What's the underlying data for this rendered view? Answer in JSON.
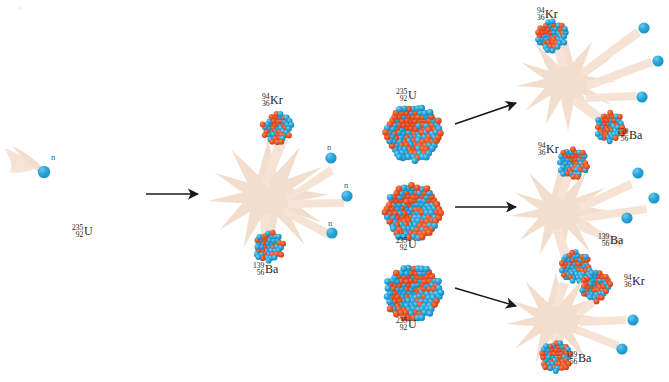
{
  "figure": {
    "background_color": "#ffffff"
  },
  "colors": {
    "proton": "#e8502a",
    "neutron_sphere": "#29a8dc",
    "burst": "#f3ddcd",
    "ray": "#f6e3d6",
    "arrow": "#1a1a1a",
    "label_text": "#231f20",
    "neutron_label_text": "#2b6c88"
  },
  "isotopes": {
    "uranium": {
      "mass": "235",
      "atomic": "92",
      "symbol": "U"
    },
    "krypton": {
      "mass": "94",
      "atomic": "36",
      "symbol": "Kr"
    },
    "barium": {
      "mass": "139",
      "atomic": "56",
      "symbol": "Ba"
    }
  },
  "neutron_label": "n",
  "generations": [
    {
      "name": "generation-0",
      "incoming_neutron_label": "n",
      "target_nucleus": {
        "mass": "235",
        "atomic": "92",
        "symbol": "U"
      }
    },
    {
      "name": "generation-1",
      "fission_events": 1,
      "products": [
        {
          "mass": "94",
          "atomic": "36",
          "symbol": "Kr"
        },
        {
          "mass": "139",
          "atomic": "56",
          "symbol": "Ba"
        }
      ],
      "neutrons_released": 3,
      "neutron_labels": [
        "n",
        "n",
        "n"
      ]
    },
    {
      "name": "generation-2-targets",
      "targets": [
        {
          "mass": "235",
          "atomic": "92",
          "symbol": "U"
        },
        {
          "mass": "235",
          "atomic": "92",
          "symbol": "U"
        },
        {
          "mass": "235",
          "atomic": "92",
          "symbol": "U"
        }
      ]
    },
    {
      "name": "generation-2",
      "fission_events": 3,
      "products_per_event": [
        {
          "mass": "94",
          "atomic": "36",
          "symbol": "Kr"
        },
        {
          "mass": "139",
          "atomic": "56",
          "symbol": "Ba"
        }
      ],
      "neutrons_per_event": 3
    }
  ],
  "labels": {
    "u_left": {
      "mass": "235",
      "atomic": "92",
      "symbol": "U"
    },
    "kr_1": {
      "mass": "94",
      "atomic": "36",
      "symbol": "Kr"
    },
    "ba_1": {
      "mass": "139",
      "atomic": "56",
      "symbol": "Ba"
    },
    "n_1a": "n",
    "n_1b": "n",
    "n_1c": "n",
    "u_mid_top": {
      "mass": "235",
      "atomic": "92",
      "symbol": "U"
    },
    "u_mid_center": {
      "mass": "235",
      "atomic": "92",
      "symbol": "U"
    },
    "u_mid_bottom": {
      "mass": "235",
      "atomic": "92",
      "symbol": "U"
    },
    "kr_top": {
      "mass": "94",
      "atomic": "36",
      "symbol": "Kr"
    },
    "ba_top": {
      "mass": "139",
      "atomic": "56",
      "symbol": "Ba"
    },
    "kr_mid": {
      "mass": "94",
      "atomic": "36",
      "symbol": "Kr"
    },
    "ba_mid": {
      "mass": "139",
      "atomic": "56",
      "symbol": "Ba"
    },
    "kr_bot": {
      "mass": "94",
      "atomic": "36",
      "symbol": "Kr"
    },
    "ba_bot": {
      "mass": "139",
      "atomic": "56",
      "symbol": "Ba"
    }
  }
}
